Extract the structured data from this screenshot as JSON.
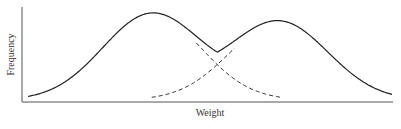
{
  "chart_data": {
    "type": "line",
    "title": "",
    "xlabel": "Weight",
    "ylabel": "Frequency",
    "grid": false,
    "legend": null,
    "axis_ticks": false,
    "x_range": [
      0,
      100
    ],
    "y_range": [
      0,
      1
    ],
    "series": [
      {
        "name": "combined distribution",
        "style": "solid",
        "description": "Bimodal sum of two normal components",
        "components": [
          "component 1",
          "component 2"
        ]
      },
      {
        "name": "component 1",
        "style": "dashed",
        "mean": 34,
        "sd": 13.5,
        "amplitude": 0.99
      },
      {
        "name": "component 2",
        "style": "dashed",
        "mean": 69,
        "sd": 13.5,
        "amplitude": 0.9
      }
    ],
    "annotations": []
  },
  "layout": {
    "plot_left": 22,
    "plot_right": 393,
    "plot_top": 7,
    "plot_bottom": 102,
    "x_min_px": 28,
    "x_max_px": 392,
    "dash_visible_threshold": 0.03,
    "line_color": "#222222",
    "axis_color": "#555555"
  }
}
